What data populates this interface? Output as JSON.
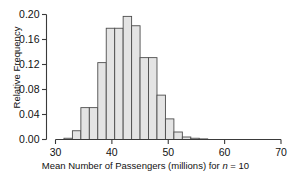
{
  "figure": {
    "background": "#ffffff",
    "axis_color": "#3a3a3a",
    "bar_fill": "#e4e4e4",
    "bar_stroke": "#4d4d4d"
  },
  "axes": {
    "y": {
      "label": "Relative Frequency",
      "ticks": [
        "0.00",
        "0.04",
        "0.08",
        "0.12",
        "0.16",
        "0.20"
      ],
      "tick_values": [
        0.0,
        0.04,
        0.08,
        0.12,
        0.16,
        0.2
      ],
      "min": 0.0,
      "max": 0.2
    },
    "x": {
      "label_prefix": "Mean Number of Passengers (millions) for ",
      "label_italic": "n",
      "label_suffix": " = 10",
      "label_full": "Mean Number of Passengers (millions) for n = 10",
      "ticks": [
        "30",
        "40",
        "50",
        "60",
        "70"
      ],
      "tick_values": [
        30,
        40,
        50,
        60,
        70
      ],
      "min": 30,
      "max": 70
    }
  },
  "chart_data": {
    "type": "bar",
    "title": "",
    "xlabel": "Mean Number of Passengers (millions) for n = 10",
    "ylabel": "Relative Frequency",
    "xlim": [
      30,
      70
    ],
    "ylim": [
      0.0,
      0.2
    ],
    "grid": false,
    "legend": "none",
    "bin_width": 1.5,
    "bin_starts": [
      30.0,
      31.5,
      33.0,
      34.5,
      36.0,
      37.5,
      39.0,
      40.5,
      42.0,
      43.5,
      45.0,
      46.5,
      48.0,
      49.5,
      51.0,
      52.5,
      54.0,
      55.5
    ],
    "categories": [
      "30.0-31.5",
      "31.5-33.0",
      "33.0-34.5",
      "34.5-36.0",
      "36.0-37.5",
      "37.5-39.0",
      "39.0-40.5",
      "40.5-42.0",
      "42.0-43.5",
      "43.5-45.0",
      "45.0-46.5",
      "46.5-48.0",
      "48.0-49.5",
      "49.5-51.0",
      "51.0-52.5",
      "52.5-54.0",
      "54.0-55.5",
      "55.5-57.0"
    ],
    "values": [
      0.0,
      0.002,
      0.014,
      0.051,
      0.051,
      0.123,
      0.123,
      0.178,
      0.197,
      0.182,
      0.182,
      0.131,
      0.071,
      0.033,
      0.012,
      0.012,
      0.004,
      0.002
    ],
    "bars": [
      {
        "x0": 30.0,
        "x1": 31.5,
        "value": 0.0
      },
      {
        "x0": 31.5,
        "x1": 33.0,
        "value": 0.002
      },
      {
        "x0": 33.0,
        "x1": 34.5,
        "value": 0.014
      },
      {
        "x0": 34.5,
        "x1": 36.0,
        "value": 0.051
      },
      {
        "x0": 36.0,
        "x1": 37.5,
        "value": 0.051
      },
      {
        "x0": 37.5,
        "x1": 39.0,
        "value": 0.123
      },
      {
        "x0": 39.0,
        "x1": 40.5,
        "value": 0.178
      },
      {
        "x0": 40.5,
        "x1": 42.0,
        "value": 0.178
      },
      {
        "x0": 42.0,
        "x1": 43.5,
        "value": 0.197
      },
      {
        "x0": 43.5,
        "x1": 45.0,
        "value": 0.182
      },
      {
        "x0": 45.0,
        "x1": 46.5,
        "value": 0.131
      },
      {
        "x0": 46.5,
        "x1": 48.0,
        "value": 0.131
      },
      {
        "x0": 48.0,
        "x1": 49.5,
        "value": 0.071
      },
      {
        "x0": 49.5,
        "x1": 51.0,
        "value": 0.033
      },
      {
        "x0": 51.0,
        "x1": 52.5,
        "value": 0.012
      },
      {
        "x0": 52.5,
        "x1": 54.0,
        "value": 0.004
      },
      {
        "x0": 54.0,
        "x1": 55.5,
        "value": 0.002
      },
      {
        "x0": 55.5,
        "x1": 57.0,
        "value": 0.001
      }
    ]
  }
}
